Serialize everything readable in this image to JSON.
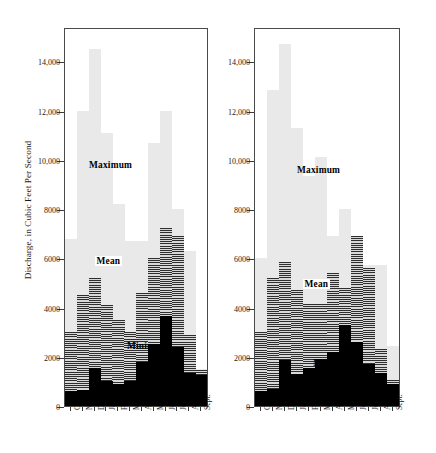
{
  "axis": {
    "ylabel": "Discharge, in Cubic Feet Per Second",
    "yticks": [
      {
        "value": 0,
        "label": "0"
      },
      {
        "value": 2000,
        "label": "2000"
      },
      {
        "value": 4000,
        "label": "4000"
      },
      {
        "value": 6000,
        "label": "6000"
      },
      {
        "value": 8000,
        "label": "8000"
      },
      {
        "value": 10000,
        "label": "10,000"
      },
      {
        "value": 12000,
        "label": "12,000"
      },
      {
        "value": 14000,
        "label": "14,000"
      }
    ],
    "ymin": 0,
    "ymax": 15400,
    "months": [
      "Oct.",
      "Nov.",
      "Dec.",
      "Jan.",
      "Feb.",
      "Mar.",
      "Apr.",
      "May",
      "June",
      "July",
      "Aug.",
      "Sept."
    ]
  },
  "series_labels": {
    "maximum": "Maximum",
    "mean": "Mean",
    "minimum": "Minimum"
  },
  "colors": {
    "maximum": "#e9e9e9",
    "mean": "#555555",
    "minimum": "#000000",
    "frame": "#4a4a4a",
    "text": "#1a1a1a"
  },
  "chart_data": [
    {
      "id": "left-panel",
      "type": "bar",
      "title": "",
      "xlabel": "",
      "ylabel": "Discharge, in Cubic Feet Per Second",
      "ylim": [
        0,
        15400
      ],
      "grid": false,
      "legend_position": "inside-plot",
      "categories": [
        "Oct.",
        "Nov.",
        "Dec.",
        "Jan.",
        "Feb.",
        "Mar.",
        "Apr.",
        "May",
        "June",
        "July",
        "Aug.",
        "Sept."
      ],
      "series": [
        {
          "name": "Maximum",
          "values": [
            6800,
            12000,
            14500,
            11100,
            8200,
            6700,
            6700,
            10700,
            12000,
            8000,
            6300,
            1500
          ]
        },
        {
          "name": "Mean",
          "values": [
            3000,
            4500,
            5200,
            4100,
            3500,
            3000,
            4600,
            6000,
            7250,
            6900,
            2900,
            1450
          ]
        },
        {
          "name": "Minimum",
          "values": [
            600,
            650,
            1550,
            1000,
            900,
            1000,
            1800,
            2500,
            3650,
            2400,
            1350,
            1250
          ]
        }
      ]
    },
    {
      "id": "right-panel",
      "type": "bar",
      "title": "",
      "xlabel": "",
      "ylabel": "Discharge, in Cubic Feet Per Second",
      "ylim": [
        0,
        15400
      ],
      "grid": false,
      "legend_position": "inside-plot",
      "categories": [
        "Oct.",
        "Nov.",
        "Dec.",
        "Jan.",
        "Feb.",
        "Mar.",
        "Apr.",
        "May",
        "June",
        "July",
        "Aug.",
        "Sept."
      ],
      "series": [
        {
          "name": "Maximum",
          "values": [
            6000,
            12850,
            14700,
            11300,
            9350,
            10100,
            6900,
            8000,
            6600,
            5750,
            5750,
            2450
          ]
        },
        {
          "name": "Mean",
          "values": [
            3000,
            5200,
            5850,
            4700,
            4150,
            4150,
            5400,
            4800,
            6900,
            5600,
            2300,
            1050
          ]
        },
        {
          "name": "Minimum",
          "values": [
            600,
            700,
            1850,
            1300,
            1550,
            1900,
            2200,
            3300,
            2600,
            1700,
            1350,
            900
          ]
        }
      ]
    }
  ]
}
